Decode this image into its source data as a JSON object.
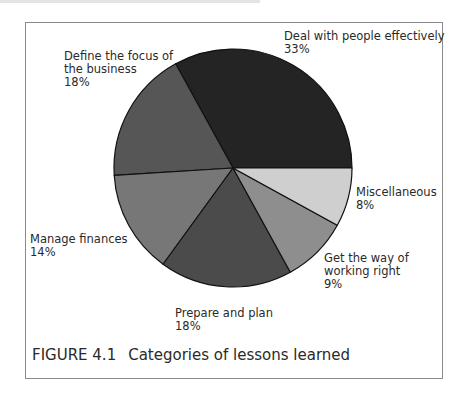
{
  "figure": {
    "number": "FIGURE 4.1",
    "caption": "Categories of lessons learned"
  },
  "labels": {
    "deal": {
      "name": "Deal with people effectively",
      "pct": "33%"
    },
    "define": {
      "name1": "Define the focus of",
      "name2": "the business",
      "pct": "18%"
    },
    "manage": {
      "name": "Manage finances",
      "pct": "14%"
    },
    "prepare": {
      "name": "Prepare and plan",
      "pct": "18%"
    },
    "getway": {
      "name1": "Get the way of",
      "name2": "working right",
      "pct": "9%"
    },
    "misc": {
      "name": "Miscellaneous",
      "pct": "8%"
    }
  },
  "chart_data": {
    "type": "pie",
    "title": "Categories of lessons learned",
    "figure_label": "FIGURE 4.1",
    "categories": [
      "Deal with people effectively",
      "Define the focus of the business",
      "Manage finances",
      "Prepare and plan",
      "Get the way of working right",
      "Miscellaneous"
    ],
    "values": [
      33,
      18,
      14,
      18,
      9,
      8
    ],
    "unit": "%",
    "colors": [
      "#242424",
      "#565656",
      "#777777",
      "#4b4b4b",
      "#8e8e8e",
      "#cfcfcf"
    ],
    "start_angle_deg": 0,
    "direction": "counterclockwise",
    "legend": "none (direct labels)"
  }
}
